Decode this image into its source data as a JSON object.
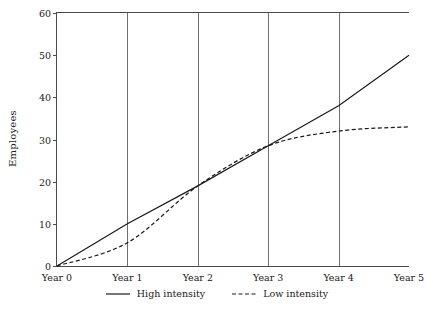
{
  "chart_data": {
    "type": "line",
    "title": "",
    "xlabel": "",
    "ylabel": "Employees",
    "x": [
      0,
      1,
      2,
      3,
      4,
      5
    ],
    "categories": [
      "Year 0",
      "Year 1",
      "Year 2",
      "Year 3",
      "Year 4",
      "Year 5"
    ],
    "series": [
      {
        "name": "High intensity",
        "style": "solid",
        "color": "#1a1a1a",
        "values": [
          0,
          10,
          19,
          28.5,
          38,
          50
        ]
      },
      {
        "name": "Low intensity",
        "style": "dashed",
        "color": "#1a1a1a",
        "values": [
          0,
          5.5,
          19,
          28.5,
          32,
          33
        ]
      }
    ],
    "xlim": [
      0,
      5
    ],
    "ylim": [
      0,
      60
    ],
    "yticks": [
      0,
      10,
      20,
      30,
      40,
      50,
      60
    ],
    "ytick_labels": [
      "0",
      "10",
      "20",
      "30",
      "40",
      "50",
      "60"
    ],
    "xtick_labels": [
      "Year 0",
      "Year 1",
      "Year 2",
      "Year 3",
      "Year 4",
      "Year 5"
    ],
    "grid": "vertical-only",
    "gridlines_x": [
      1,
      2,
      3,
      4
    ],
    "legend_position": "bottom-center",
    "legend": [
      "High intensity",
      "Low intensity"
    ]
  },
  "axis": {
    "y_title": "Employees"
  },
  "legend": {
    "items": [
      {
        "label": "High intensity"
      },
      {
        "label": "Low intensity"
      }
    ]
  }
}
